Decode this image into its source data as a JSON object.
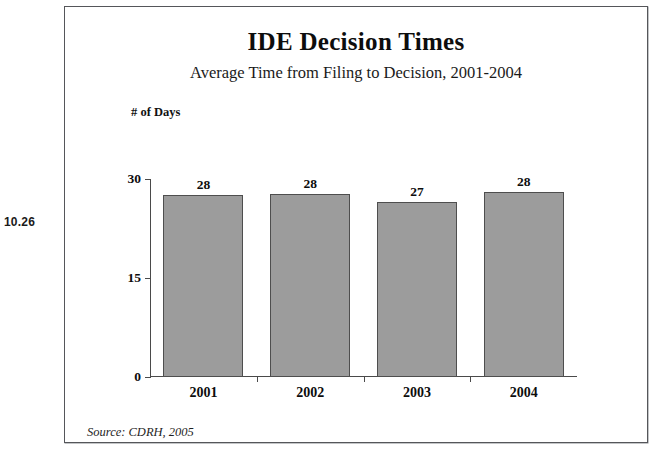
{
  "page": {
    "margin_note": "10.26"
  },
  "chart_data": {
    "type": "bar",
    "title": "IDE Decision Times",
    "subtitle": "Average Time from Filing to Decision, 2001-2004",
    "xlabel": "",
    "ylabel": "# of Days",
    "categories": [
      "2001",
      "2002",
      "2003",
      "2004"
    ],
    "values": [
      28,
      28,
      27,
      28
    ],
    "bar_pixel_values": [
      27.6,
      27.7,
      26.5,
      28.0
    ],
    "data_labels": [
      "28",
      "28",
      "27",
      "28"
    ],
    "ylim": [
      0,
      30
    ],
    "yticks": [
      0,
      15,
      30
    ],
    "ytick_labels": [
      "0",
      "15",
      "30"
    ],
    "grid": false,
    "legend": null,
    "series_color": "#9c9c9c",
    "series_border_color": "#4e4e4e",
    "axis_color": "#4a4a4a",
    "source_note": "Source: CDRH, 2005"
  }
}
